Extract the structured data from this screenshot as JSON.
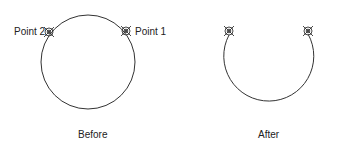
{
  "before": {
    "caption": "Before",
    "point1_label": "Point 1",
    "point2_label": "Point 2"
  },
  "after": {
    "caption": "After"
  },
  "colors": {
    "stroke": "#333333",
    "background": "#ffffff"
  }
}
